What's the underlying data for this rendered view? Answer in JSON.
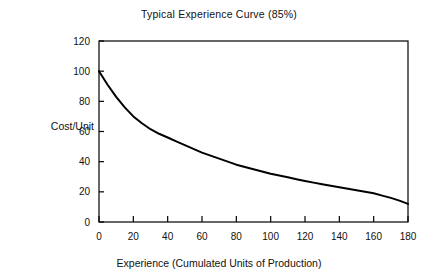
{
  "chart_data": {
    "type": "line",
    "title": "Typical Experience Curve (85%)",
    "xlabel": "Experience (Cumulated Units of Production)",
    "ylabel": "Cost/Unit",
    "xlim": [
      0,
      180
    ],
    "ylim": [
      0,
      120
    ],
    "xticks": [
      0,
      20,
      40,
      60,
      80,
      100,
      120,
      140,
      160,
      180
    ],
    "yticks": [
      0,
      20,
      40,
      60,
      80,
      100,
      120
    ],
    "grid": false,
    "legend": null,
    "line_color": "#000000",
    "series": [
      {
        "name": "Typical Experience Curve (85%)",
        "x": [
          0,
          5,
          10,
          15,
          20,
          25,
          30,
          35,
          40,
          45,
          50,
          55,
          60,
          65,
          70,
          75,
          80,
          85,
          90,
          95,
          100,
          105,
          110,
          115,
          120,
          125,
          130,
          135,
          140,
          145,
          150,
          155,
          160,
          165,
          170,
          175,
          180
        ],
        "values": [
          100,
          91,
          83,
          76,
          70,
          65.5,
          61.5,
          58.5,
          56,
          53.5,
          51,
          48.5,
          46,
          44,
          42,
          40,
          38,
          36.5,
          35,
          33.5,
          32,
          30.8,
          29.6,
          28.4,
          27.2,
          26.1,
          25,
          24,
          23,
          22,
          21,
          20,
          19,
          17.5,
          16,
          14.2,
          12
        ]
      }
    ]
  },
  "axis": {
    "x_tick_labels": [
      "0",
      "20",
      "40",
      "60",
      "80",
      "100",
      "120",
      "140",
      "160",
      "180"
    ],
    "y_tick_labels": [
      "0",
      "20",
      "40",
      "60",
      "80",
      "100",
      "120"
    ]
  }
}
